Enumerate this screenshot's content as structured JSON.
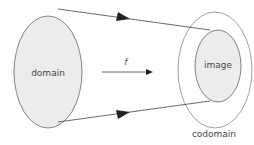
{
  "diagram": {
    "labels": {
      "domain": "domain",
      "image": "image",
      "codomain": "codomain",
      "function": "f"
    },
    "colors": {
      "fill": "#ececec",
      "stroke": "#555555",
      "text": "#444444"
    }
  }
}
